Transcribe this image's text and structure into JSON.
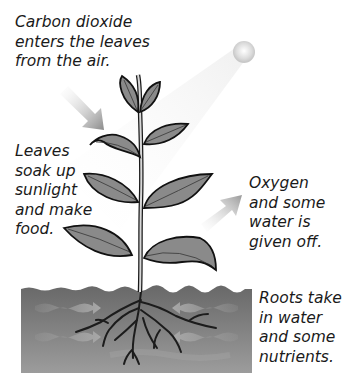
{
  "labels": {
    "carbon_dioxide": "Carbon dioxide\nenters the leaves\nfrom the air.",
    "leaves": "Leaves\nsoak up\nsunlight\nand make\nfood.",
    "oxygen": "Oxygen\nand some\nwater is\ngiven off.",
    "roots": "Roots take\nin water\nand some\nnutrients."
  },
  "colors": {
    "leaf_fill": "#8a8a8a",
    "leaf_outline": "#111111",
    "soil_top": "#6e6e6e",
    "soil_bottom": "#9a9a9a",
    "arrow": "#b5b5b5",
    "sun": "#e6e6e6"
  }
}
